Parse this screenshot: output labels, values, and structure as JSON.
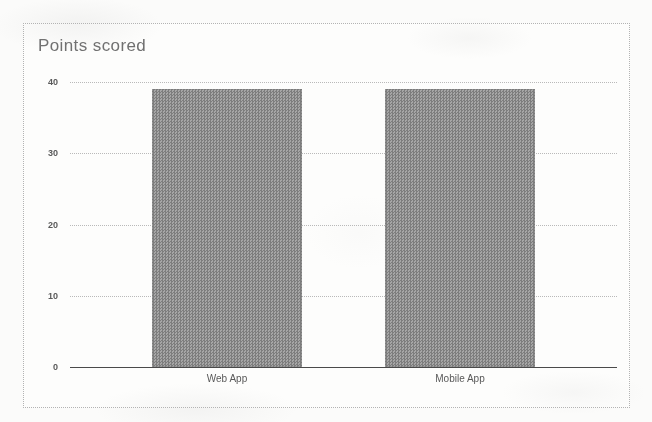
{
  "chart_data": {
    "type": "bar",
    "title": "Points scored",
    "xlabel": "",
    "ylabel": "",
    "categories": [
      "Web App",
      "Mobile App"
    ],
    "values": [
      39,
      39
    ],
    "series": [
      {
        "name": "Points scored",
        "values": [
          39,
          39
        ]
      }
    ],
    "ylim": [
      0,
      40
    ],
    "yticks": [
      0,
      10,
      20,
      30,
      40
    ],
    "ytick_labels": [
      "0",
      "10",
      "20",
      "30",
      "40"
    ],
    "grid": true,
    "grid_style": "dotted-horizontal",
    "legend": false,
    "legend_position": "none",
    "bar_color": "#8d8d8d",
    "axis_color": "#4a4a4a",
    "gridline_color": "#b9b9b9",
    "title_color": "#6f6f6f",
    "background_color": "#fdfdfc",
    "frame_color": "#b3b3b3",
    "annotations": []
  }
}
